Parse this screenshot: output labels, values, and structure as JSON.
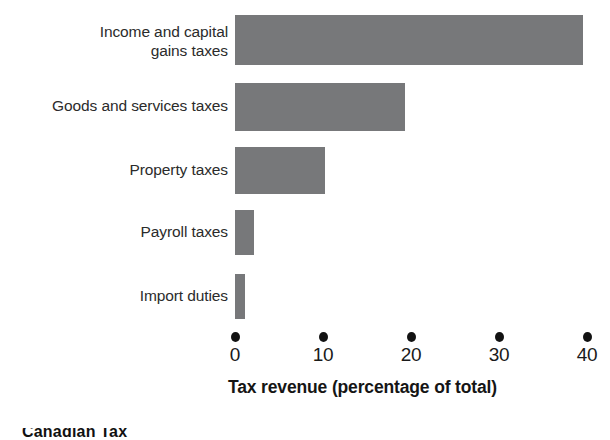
{
  "chart_data": {
    "type": "bar",
    "orientation": "horizontal",
    "title": "",
    "xlabel": "Tax revenue (percentage of total)",
    "ylabel": "",
    "categories": [
      "Income and capital\ngains taxes",
      "Goods and services taxes",
      "Property taxes",
      "Payroll taxes",
      "Import duties"
    ],
    "values": [
      39.5,
      19.3,
      10.2,
      2.2,
      1.1
    ],
    "xlim": [
      0,
      40
    ],
    "xticks": [
      0,
      10,
      20,
      30,
      40
    ],
    "xtick_labels": [
      "0",
      "10",
      "20",
      "30",
      "40"
    ],
    "grid": false,
    "legend": false,
    "bar_color": "#77787a",
    "tick_marker_style": "filled-dot",
    "axis_line": false
  },
  "labels": {
    "cat0_line1": "Income and capital",
    "cat0_line2": "gains taxes",
    "cat1": "Goods and services taxes",
    "cat2": "Property taxes",
    "cat3": "Payroll taxes",
    "cat4": "Import duties"
  },
  "ticks": {
    "t0": "0",
    "t1": "10",
    "t2": "20",
    "t3": "30",
    "t4": "40"
  },
  "axis": {
    "title": "Tax revenue (percentage of total)"
  },
  "caption": {
    "partial_text": "Canadian Tax"
  },
  "colors": {
    "bar": "#77787a",
    "text": "#2b2b2b",
    "tick_dot": "#121212",
    "background": "#ffffff"
  }
}
